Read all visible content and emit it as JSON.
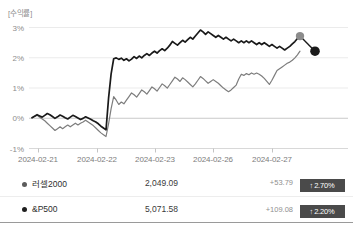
{
  "chart_data": {
    "type": "line",
    "title": "[수익률]",
    "xlabel": "",
    "ylabel": "",
    "ylim": [
      -1,
      3.2
    ],
    "yticks": [
      3,
      2,
      1,
      0,
      -1
    ],
    "ytick_labels": [
      "3%",
      "2%",
      "1%",
      "0%",
      "-1%"
    ],
    "grid": true,
    "legend_position": "below-table",
    "x_tick_labels": [
      "2024-02-21",
      "2024-02-22",
      "2024-02-23",
      "2024-02-26",
      "2024-02-27"
    ],
    "x_tick_positions": [
      38,
      97,
      155,
      213,
      272
    ],
    "annotations": [
      {
        "label": "러셀2000 endpoint marker",
        "value": 2.7,
        "color": "#8c8c8c"
      },
      {
        "label": "&P500 endpoint marker",
        "value": 2.2,
        "color": "#1a1a1a"
      }
    ],
    "series": [
      {
        "name": "러셀2000",
        "color": "#1a1a1a",
        "end_marker_color": "#8c8c8c",
        "final_value": 2.7,
        "values": [
          0.0,
          0.05,
          0.1,
          0.06,
          0.02,
          0.08,
          0.14,
          0.1,
          0.04,
          -0.02,
          0.03,
          0.09,
          0.05,
          0.0,
          -0.04,
          0.02,
          0.08,
          0.04,
          -0.01,
          -0.06,
          -0.02,
          0.03,
          -0.01,
          -0.05,
          -0.1,
          -0.14,
          -0.2,
          -0.28,
          -0.34,
          -0.4,
          0.65,
          1.45,
          1.95,
          1.98,
          1.93,
          1.97,
          1.9,
          1.95,
          1.88,
          1.94,
          2.02,
          1.96,
          2.04,
          1.98,
          2.06,
          2.12,
          2.06,
          2.14,
          2.2,
          2.14,
          2.22,
          2.28,
          2.22,
          2.3,
          2.4,
          2.52,
          2.46,
          2.4,
          2.48,
          2.56,
          2.5,
          2.58,
          2.66,
          2.6,
          2.7,
          2.8,
          2.9,
          2.84,
          2.76,
          2.84,
          2.78,
          2.72,
          2.66,
          2.72,
          2.66,
          2.6,
          2.66,
          2.6,
          2.54,
          2.6,
          2.54,
          2.48,
          2.54,
          2.48,
          2.54,
          2.48,
          2.54,
          2.48,
          2.42,
          2.48,
          2.42,
          2.48,
          2.42,
          2.36,
          2.42,
          2.36,
          2.3,
          2.36,
          2.3,
          2.24,
          2.3,
          2.36,
          2.44,
          2.52,
          2.62,
          2.7
        ]
      },
      {
        "name": "&P500",
        "color": "#7d7d7d",
        "end_marker_color": "#1a1a1a",
        "final_value": 2.2,
        "values": [
          0.0,
          0.04,
          0.08,
          0.02,
          -0.04,
          -0.1,
          -0.18,
          -0.26,
          -0.34,
          -0.42,
          -0.36,
          -0.3,
          -0.36,
          -0.3,
          -0.24,
          -0.3,
          -0.24,
          -0.18,
          -0.24,
          -0.18,
          -0.14,
          -0.08,
          -0.14,
          -0.2,
          -0.26,
          -0.34,
          -0.42,
          -0.5,
          -0.56,
          -0.62,
          -0.2,
          0.3,
          0.7,
          0.58,
          0.44,
          0.52,
          0.46,
          0.58,
          0.7,
          0.82,
          0.76,
          0.68,
          0.8,
          0.92,
          0.86,
          0.78,
          0.9,
          1.02,
          0.96,
          0.88,
          1.0,
          1.12,
          1.06,
          0.98,
          1.1,
          1.22,
          1.34,
          1.28,
          1.2,
          1.32,
          1.26,
          1.18,
          1.1,
          1.02,
          1.12,
          1.24,
          1.36,
          1.3,
          1.22,
          1.14,
          1.2,
          1.26,
          1.2,
          1.14,
          1.06,
          0.98,
          0.92,
          0.86,
          0.92,
          1.0,
          1.08,
          1.28,
          1.44,
          1.4,
          1.46,
          1.42,
          1.48,
          1.44,
          1.48,
          1.44,
          1.38,
          1.3,
          1.2,
          1.1,
          1.24,
          1.4,
          1.56,
          1.62,
          1.68,
          1.74,
          1.8,
          1.84,
          1.9,
          1.98,
          2.08,
          2.2
        ]
      }
    ]
  },
  "legend": {
    "rows": [
      {
        "name": "러셀2000",
        "dot_color": "#5c5c5c",
        "value": "2,049.09",
        "change": "+53.79",
        "badge_arrow": "↑",
        "badge_pct": "2.70%",
        "badge_color": "#4a4a4a"
      },
      {
        "name": "&P500",
        "dot_color": "#1f1f1f",
        "value": "5,071.58",
        "change": "+109.08",
        "badge_arrow": "↑",
        "badge_pct": "2.20%",
        "badge_color": "#4a4a4a"
      }
    ]
  }
}
